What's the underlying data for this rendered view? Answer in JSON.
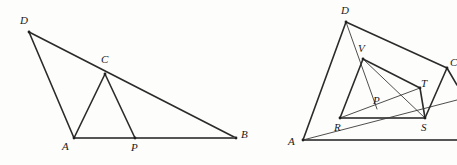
{
  "sheet": {
    "width": 457,
    "height": 165,
    "background": "#fdfdfb",
    "ink": "#2b2b2b"
  },
  "figures": [
    {
      "id": "left-figure",
      "name": "triangle-dab-with-inscribed-triangle-acp",
      "points": {
        "D": {
          "x": 29,
          "y": 32,
          "label": "D",
          "label_x": 20,
          "label_y": 24
        },
        "C": {
          "x": 105,
          "y": 74,
          "label": "C",
          "label_x": 101,
          "label_y": 63
        },
        "A": {
          "x": 74,
          "y": 138,
          "label": "A",
          "label_x": 62,
          "label_y": 150
        },
        "P": {
          "x": 135,
          "y": 138,
          "label": "P",
          "label_x": 131,
          "label_y": 151
        },
        "B": {
          "x": 236,
          "y": 138,
          "label": "B",
          "label_x": 241,
          "label_y": 138
        }
      },
      "segments": [
        {
          "name": "segment-DA",
          "from": "D",
          "to": "A",
          "weight": "main"
        },
        {
          "name": "segment-DB",
          "from": "D",
          "to": "B",
          "weight": "main"
        },
        {
          "name": "segment-AB",
          "from": "A",
          "to": "B",
          "weight": "base"
        },
        {
          "name": "segment-AC",
          "from": "A",
          "to": "C",
          "weight": "main"
        },
        {
          "name": "segment-CP",
          "from": "C",
          "to": "P",
          "weight": "main"
        }
      ],
      "vertex_markers": [
        "D",
        "C",
        "A",
        "P",
        "B"
      ]
    },
    {
      "id": "right-figure",
      "name": "triangle-adc-with-inner-quadrilateral-rstv",
      "points": {
        "D": {
          "x": 346,
          "y": 22,
          "label": "D",
          "label_x": 341,
          "label_y": 14
        },
        "V": {
          "x": 363,
          "y": 59,
          "label": "V",
          "label_x": 358,
          "label_y": 52
        },
        "C": {
          "x": 447,
          "y": 68,
          "label": "C",
          "label_x": 450,
          "label_y": 66
        },
        "T": {
          "x": 420,
          "y": 88,
          "label": "T",
          "label_x": 421,
          "label_y": 87
        },
        "P": {
          "x": 377,
          "y": 109,
          "label": "P",
          "label_x": 373,
          "label_y": 104
        },
        "R": {
          "x": 340,
          "y": 118,
          "label": "R",
          "label_x": 334,
          "label_y": 131
        },
        "S": {
          "x": 425,
          "y": 118,
          "label": "S",
          "label_x": 421,
          "label_y": 131
        },
        "A": {
          "x": 303,
          "y": 140,
          "label": "A",
          "label_x": 288,
          "label_y": 145
        },
        "Bedge": {
          "x": 457,
          "y": 140,
          "label": "",
          "label_x": 457,
          "label_y": 140
        },
        "Cext": {
          "x": 457,
          "y": 100,
          "label": "",
          "label_x": 457,
          "label_y": 100
        },
        "Dext": {
          "x": 457,
          "y": 85,
          "label": "",
          "label_x": 457,
          "label_y": 85
        }
      },
      "segments": [
        {
          "name": "segment-AD",
          "from": "A",
          "to": "D",
          "weight": "main"
        },
        {
          "name": "segment-DC",
          "from": "D",
          "to": "C",
          "weight": "main"
        },
        {
          "name": "segment-A-baseline",
          "from": "A",
          "to": "Bedge",
          "weight": "base"
        },
        {
          "name": "segment-DV-through-P",
          "from": "D",
          "to": "P",
          "weight": "thin"
        },
        {
          "name": "segment-VR",
          "from": "V",
          "to": "R",
          "weight": "main"
        },
        {
          "name": "segment-VT",
          "from": "V",
          "to": "T",
          "weight": "main"
        },
        {
          "name": "segment-RS",
          "from": "R",
          "to": "S",
          "weight": "base"
        },
        {
          "name": "segment-ST",
          "from": "S",
          "to": "T",
          "weight": "main"
        },
        {
          "name": "segment-AR-extended",
          "from": "A",
          "to": "Cext",
          "weight": "thin"
        },
        {
          "name": "segment-RT-diagonal",
          "from": "R",
          "to": "T",
          "weight": "thin"
        },
        {
          "name": "segment-VS",
          "from": "V",
          "to": "S",
          "weight": "thin"
        },
        {
          "name": "segment-CS",
          "from": "C",
          "to": "S",
          "weight": "main"
        },
        {
          "name": "segment-C-extension",
          "from": "C",
          "to": "Dext",
          "weight": "main"
        }
      ],
      "vertex_markers": [
        "D",
        "V",
        "C",
        "T",
        "R",
        "S",
        "A"
      ]
    }
  ]
}
